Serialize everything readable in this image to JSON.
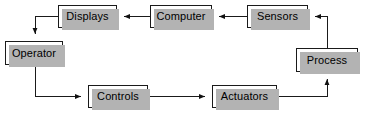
{
  "diagram": {
    "stroke_color": "#1a1a1a",
    "box_fill": "#ffffff",
    "shadow_color": "#b3b3b3",
    "background": "#ffffff",
    "nodes": [
      {
        "id": "displays",
        "label": "Displays",
        "x": 58,
        "y": 5,
        "w": 59,
        "h": 23
      },
      {
        "id": "computer",
        "label": "Computer",
        "x": 150,
        "y": 5,
        "w": 62,
        "h": 23
      },
      {
        "id": "sensors",
        "label": "Sensors",
        "x": 247,
        "y": 5,
        "w": 61,
        "h": 23
      },
      {
        "id": "operator",
        "label": "Operator",
        "x": 5,
        "y": 41,
        "w": 58,
        "h": 24
      },
      {
        "id": "process",
        "label": "Process",
        "x": 296,
        "y": 48,
        "w": 62,
        "h": 24
      },
      {
        "id": "controls",
        "label": "Controls",
        "x": 88,
        "y": 85,
        "w": 60,
        "h": 23
      },
      {
        "id": "actuators",
        "label": "Actuators",
        "x": 212,
        "y": 85,
        "w": 65,
        "h": 23
      }
    ],
    "edges": [
      {
        "id": "computer-to-displays",
        "from": "Computer",
        "to": "Displays"
      },
      {
        "id": "sensors-to-computer",
        "from": "Sensors",
        "to": "Computer"
      },
      {
        "id": "process-to-sensors",
        "from": "Process",
        "to": "Sensors"
      },
      {
        "id": "displays-to-operator",
        "from": "Displays",
        "to": "Operator"
      },
      {
        "id": "operator-to-controls",
        "from": "Operator",
        "to": "Controls"
      },
      {
        "id": "controls-to-actuators",
        "from": "Controls",
        "to": "Actuators"
      },
      {
        "id": "actuators-to-process",
        "from": "Actuators",
        "to": "Process"
      }
    ]
  }
}
